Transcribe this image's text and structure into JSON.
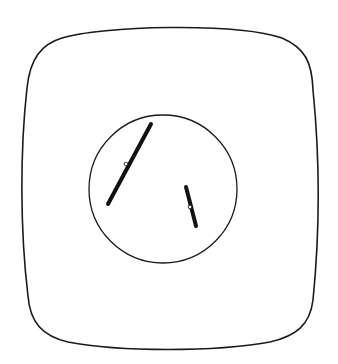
{
  "figure": {
    "type": "cell-diagram",
    "colors": {
      "background": "#ffffff",
      "stroke": "#1a1a1a",
      "chromosome": "#111111",
      "centromere": "#ffffff"
    },
    "cell_membrane": {
      "label": ""
    },
    "nucleus": {
      "label": "",
      "cx": 163,
      "cy": 189,
      "r": 74
    },
    "chromosomes": [
      {
        "id": "long",
        "x1": 151,
        "y1": 124,
        "x2": 108,
        "y2": 204,
        "centromere_x": 126,
        "centromere_y": 164
      },
      {
        "id": "short",
        "x1": 186,
        "y1": 187,
        "x2": 196,
        "y2": 226,
        "centromere_x": 190,
        "centromere_y": 207
      }
    ]
  },
  "caption": {
    "text": ""
  }
}
